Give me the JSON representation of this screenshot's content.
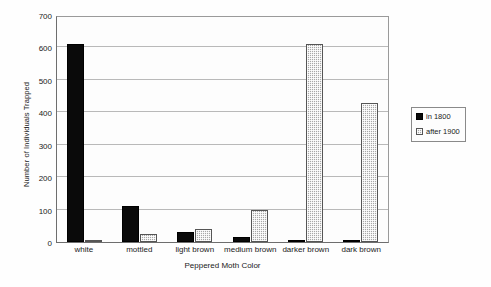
{
  "chart_data": {
    "type": "bar",
    "title": "",
    "xlabel": "Peppered Moth Color",
    "ylabel": "Number of Individuals Trapped",
    "categories": [
      "white",
      "mottled",
      "light brown",
      "medium brown",
      "darker brown",
      "dark brown"
    ],
    "series": [
      {
        "name": "in 1800",
        "color": "#000000",
        "values": [
          610,
          110,
          30,
          15,
          5,
          3
        ]
      },
      {
        "name": "after 1900",
        "color": "#a8a8a8",
        "values": [
          5,
          25,
          40,
          100,
          610,
          428
        ]
      }
    ],
    "ylim": [
      0,
      700
    ],
    "yticks": [
      0,
      100,
      200,
      300,
      400,
      500,
      600,
      700
    ],
    "ytick_labels": [
      "0",
      "100",
      "200",
      "300",
      "400",
      "500",
      "600",
      "700"
    ],
    "grid": true,
    "grid_axis": "y",
    "legend_position": "right",
    "legend_entries": [
      "in 1800",
      "after 1900"
    ]
  },
  "legend": {
    "items": [
      {
        "label": "in 1800",
        "swatch": "legend-swatch-black"
      },
      {
        "label": "after 1900",
        "swatch": "legend-swatch-gray"
      }
    ]
  }
}
